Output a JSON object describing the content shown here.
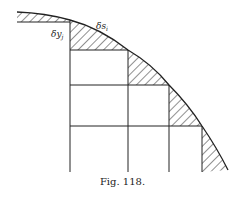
{
  "figure": {
    "caption": "Fig. 118.",
    "labels": {
      "arc_element": "δs",
      "arc_element_sub": "i",
      "height_element": "δy",
      "height_element_sub": "j"
    }
  },
  "colors": {
    "ink": "#222222",
    "background": "#ffffff"
  }
}
